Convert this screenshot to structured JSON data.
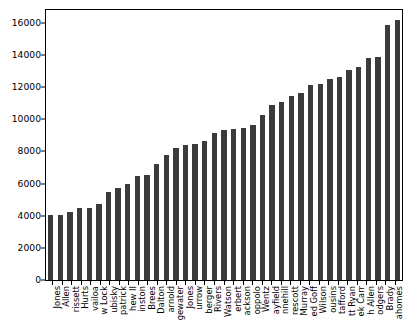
{
  "chart_data": {
    "type": "bar",
    "title": "",
    "xlabel": "",
    "ylabel": "",
    "ylim": [
      0,
      16800
    ],
    "yticks": [
      0,
      2000,
      4000,
      6000,
      8000,
      10000,
      12000,
      14000,
      16000
    ],
    "ytick_labels": [
      "0",
      "2000",
      "4000",
      "6000",
      "8000",
      "10000",
      "12000",
      "14000",
      "16000"
    ],
    "grid": false,
    "legend": null,
    "bar_color": "#3b3b3b",
    "orientation": "vertical",
    "xtick_rotation": -90,
    "categories": [
      "Daniel Jones",
      "Kyle Allen",
      "Jacoby Brissett",
      "Jalen Hurts",
      "Tua Tagovailoa",
      "Drew Lock",
      "Mitchell Trubisky",
      "Ryan Fitzpatrick",
      "Cam Newton II",
      "Jameis Winston",
      "Drew Brees",
      "Andy Dalton",
      "Sam Darnold",
      "Teddy Bridgewater",
      "Mac Jones",
      "Joe Burrow",
      "Ben Roethlisberger",
      "Philip Rivers",
      "Deshaun Watson",
      "Justin Herbert",
      "Lamar Jackson",
      "Jimmy Garoppolo",
      "Carson Wentz",
      "Baker Mayfield",
      "Ryan Tannehill",
      "Dak Prescott",
      "Kyler Murray",
      "Jared Goff",
      "Russell Wilson",
      "Kirk Cousins",
      "Matthew Stafford",
      "Matt Ryan",
      "Derek Carr",
      "Josh Allen",
      "Aaron Rodgers",
      "Tom Brady",
      "Patrick Mahomes"
    ],
    "tick_labels_visible": [
      "Jones",
      "Allen",
      "rissett",
      "Hurts",
      "vailoa",
      "w Lock",
      "ubisky",
      "patrick",
      "hew II",
      "inston",
      "Brees",
      "Dalton",
      "arnold",
      "gewater",
      "Jones",
      "urrow",
      "berger",
      "Rivers",
      "Watson",
      "erbert",
      "ackson",
      "oppolo",
      "Wentz",
      "ayfield",
      "nnehill",
      "rescott",
      "Murray",
      "ed Goff",
      "Wilson",
      "ousins",
      "tafford",
      "tt Ryan",
      "ek Carr",
      "h Allen",
      "odgers",
      "Brady",
      "ahomes"
    ],
    "values": [
      4050,
      4060,
      4230,
      4450,
      4480,
      4760,
      5470,
      5700,
      6000,
      6450,
      6560,
      7210,
      7800,
      8210,
      8400,
      8440,
      8660,
      9120,
      9330,
      9390,
      9480,
      9660,
      10250,
      10900,
      11080,
      11480,
      11640,
      12140,
      12200,
      12520,
      12660,
      13040,
      13280,
      13790,
      13880,
      15890,
      16150
    ]
  }
}
